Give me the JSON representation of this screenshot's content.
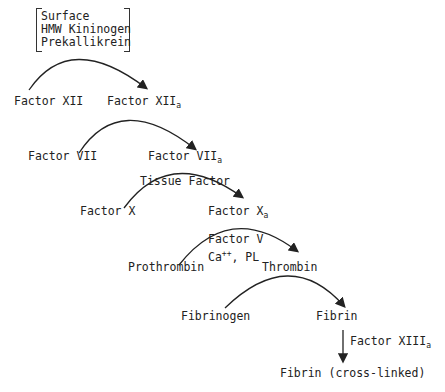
{
  "cofactors_box": [
    "Surface",
    "HMW Kininogen",
    "Prekallikrein"
  ],
  "steps": [
    {
      "substrate": "Factor XII",
      "product_base": "Factor XII",
      "product_sub": "a"
    },
    {
      "substrate": "Factor VII",
      "product_base": "Factor VII",
      "product_sub": "a"
    },
    {
      "substrate": "Factor X",
      "product_base": "Factor X",
      "product_sub": "a",
      "cofactor": "Tissue Factor"
    },
    {
      "substrate": "Prothrombin",
      "product_base": "Thrombin",
      "cofactor_line1": "Factor V",
      "cofactor_line2_base": "Ca",
      "cofactor_line2_sup": "++",
      "cofactor_line2_rest": ", PL"
    },
    {
      "substrate": "Fibrinogen",
      "product_base": "Fibrin"
    }
  ],
  "final": {
    "enzyme_base": "Factor XIII",
    "enzyme_sub": "a",
    "product": "Fibrin (cross-linked)"
  }
}
